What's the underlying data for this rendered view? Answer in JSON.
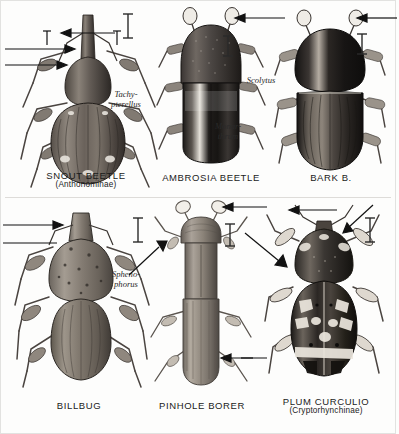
{
  "plate": {
    "title_implicit": "Weevil and bark beetle plate",
    "background_color": "#fdfdfc",
    "ink_color": "#1b1b1b",
    "divider_color": "#d8d6d2"
  },
  "figures": [
    {
      "id": "snout-beetle",
      "common_name": "SNOUT BEETLE",
      "subfamily": "(Anthonominae)",
      "genus": "Tachy-\npterellus",
      "genus_line1": "Tachy-",
      "genus_line2": "pterellus",
      "row": "top",
      "column": "left",
      "scale_bar": "I",
      "pointer_count": 4,
      "body_tone": "#4a4440"
    },
    {
      "id": "ambrosia-beetle",
      "common_name": "AMBROSIA BEETLE",
      "subfamily": "",
      "genus_line1": "Monar-",
      "genus_line2": "thrum",
      "row": "top",
      "column": "center",
      "scale_bar": "I",
      "pointer_count": 1,
      "body_tone": "#2e2b29"
    },
    {
      "id": "bark-beetle",
      "common_name": "BARK B.",
      "subfamily": "",
      "genus_line1": "Scolytus",
      "genus_line2": "",
      "row": "top",
      "column": "right",
      "scale_bar": "I",
      "pointer_count": 1,
      "body_tone": "#26231f"
    },
    {
      "id": "billbug",
      "common_name": "BILLBUG",
      "subfamily": "",
      "genus_line1": "Spheno-",
      "genus_line2": "phorus",
      "row": "bottom",
      "column": "left",
      "scale_bar": "I",
      "pointer_count": 2,
      "body_tone": "#6d6862"
    },
    {
      "id": "pinhole-borer",
      "common_name": "PINHOLE BORER",
      "subfamily": "",
      "genus_line1": "",
      "genus_line2": "",
      "row": "bottom",
      "column": "center",
      "scale_bar": "I",
      "pointer_count": 3,
      "body_tone": "#8a857e"
    },
    {
      "id": "plum-curculio",
      "common_name": "PLUM CURCULIO",
      "subfamily": "(Cryptorhynchinae)",
      "genus_line1": "",
      "genus_line2": "",
      "row": "bottom",
      "column": "right",
      "scale_bar": "I",
      "pointer_count": 4,
      "body_tone": "#2b2825"
    }
  ]
}
